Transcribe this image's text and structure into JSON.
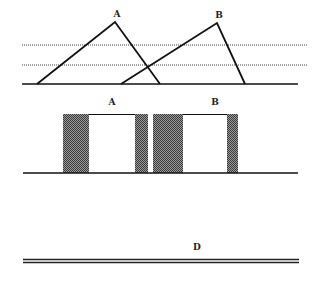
{
  "figure": {
    "panel_top": {
      "description": "Two overlapping triangles on a baseline with two dotted horizontal lines",
      "triangles": [
        {
          "label": "A",
          "apex": [
            115,
            22
          ],
          "base_left": [
            37,
            84
          ],
          "base_right": [
            160,
            84
          ],
          "label_pos": [
            117,
            14
          ]
        },
        {
          "label": "B",
          "apex": [
            217,
            23
          ],
          "base_left": [
            121,
            84
          ],
          "base_right": [
            245,
            84
          ],
          "label_pos": [
            219,
            15
          ]
        }
      ],
      "baseline": {
        "y": 84,
        "x1": 22,
        "x2": 298
      },
      "dotted_lines": [
        {
          "y": 45,
          "x1": 22,
          "x2": 308
        },
        {
          "y": 65,
          "x1": 22,
          "x2": 308
        }
      ]
    },
    "panel_middle": {
      "description": "Two rectangular pulses with shaded margins on a baseline",
      "labels": [
        {
          "text": "A",
          "pos": [
            112,
            102
          ]
        },
        {
          "text": "B",
          "pos": [
            215,
            102
          ]
        }
      ],
      "baseline": {
        "y": 173,
        "x1": 23,
        "x2": 298
      },
      "blocks": [
        {
          "label": "A",
          "shade_left": [
            63,
            89
          ],
          "white": [
            89,
            135
          ],
          "shade_right": [
            135,
            148
          ],
          "top": 114,
          "bottom": 173
        },
        {
          "label": "B",
          "shade_left": [
            153,
            183
          ],
          "white": [
            183,
            227
          ],
          "shade_right": [
            227,
            238
          ],
          "top": 114,
          "bottom": 173
        }
      ],
      "colors": {
        "shade": "#555555",
        "line": "#111111"
      }
    },
    "panel_bottom": {
      "description": "Double horizontal line",
      "label": {
        "text": "D",
        "pos": [
          197,
          247
        ]
      },
      "lines": [
        {
          "y": 259.5,
          "x1": 23,
          "x2": 299
        },
        {
          "y": 262.5,
          "x1": 23,
          "x2": 299
        }
      ]
    }
  },
  "labels": {
    "tri_a": "A",
    "tri_b": "B",
    "box_a": "A",
    "box_b": "B",
    "line_d": "D"
  }
}
